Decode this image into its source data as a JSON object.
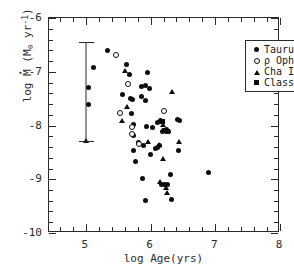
{
  "chart_data": {
    "type": "scatter",
    "title": "",
    "xlabel": "log Age(yrs)",
    "ylabel": "log Mdot (Msun yr^-1)",
    "xlabel_parts": {
      "prefix": "log Age(yrs)"
    },
    "ylabel_parts": {
      "log": "log",
      "mdot": "M",
      "open_paren": " (M",
      "sun": "⊙",
      "yr": " yr",
      "exp": "-1",
      "close_paren": ")"
    },
    "xlim": [
      4.43,
      8.0
    ],
    "ylim": [
      -10.0,
      -6.0
    ],
    "grid": false,
    "legend_position": "upper right",
    "xticks_major": [
      {
        "value": 5,
        "label": "5"
      },
      {
        "value": 6,
        "label": "6"
      },
      {
        "value": 7,
        "label": "7"
      },
      {
        "value": 8,
        "label": "8"
      }
    ],
    "xticks_minor": [
      4.6,
      4.8,
      5.2,
      5.4,
      5.6,
      5.8,
      6.2,
      6.4,
      6.6,
      6.8,
      7.2,
      7.4,
      7.6,
      7.8
    ],
    "yticks_major": [
      {
        "value": -6,
        "label": "-6"
      },
      {
        "value": -7,
        "label": "-7"
      },
      {
        "value": -8,
        "label": "-8"
      },
      {
        "value": -9,
        "label": "-9"
      },
      {
        "value": -10,
        "label": "-10"
      }
    ],
    "yticks_minor": [
      -6.2,
      -6.4,
      -6.6,
      -6.8,
      -7.2,
      -7.4,
      -7.6,
      -7.8,
      -8.2,
      -8.4,
      -8.6,
      -8.8,
      -9.2,
      -9.4,
      -9.6,
      -9.8
    ],
    "legend": [
      {
        "name": "Taurus",
        "marker": "filled-circle"
      },
      {
        "name": "ρ Oph",
        "marker": "open-circle"
      },
      {
        "name": "Cha I",
        "marker": "triangle"
      },
      {
        "name": "Class I Taurus",
        "marker": "square"
      }
    ],
    "errorbar": {
      "x": 5.0,
      "y_top": -6.45,
      "y_bottom": -8.3,
      "label": "representative-uncertainty"
    },
    "series": [
      {
        "name": "Taurus",
        "marker": "filled-circle",
        "points": [
          [
            5.04,
            -7.3
          ],
          [
            5.04,
            -7.6
          ],
          [
            5.12,
            -6.92
          ],
          [
            5.33,
            -6.6
          ],
          [
            5.62,
            -6.87
          ],
          [
            5.56,
            -7.42
          ],
          [
            5.68,
            -7.05
          ],
          [
            5.95,
            -7.02
          ],
          [
            5.86,
            -7.28
          ],
          [
            5.92,
            -7.26
          ],
          [
            5.99,
            -7.32
          ],
          [
            5.69,
            -7.5
          ],
          [
            5.72,
            -7.51
          ],
          [
            5.86,
            -7.46
          ],
          [
            5.92,
            -7.54
          ],
          [
            5.7,
            -7.77
          ],
          [
            5.73,
            -7.98
          ],
          [
            5.74,
            -8.18
          ],
          [
            5.74,
            -8.46
          ],
          [
            5.76,
            -8.67
          ],
          [
            5.82,
            -8.31
          ],
          [
            5.93,
            -8.02
          ],
          [
            6.03,
            -8.04
          ],
          [
            6.1,
            -7.94
          ],
          [
            6.16,
            -7.9
          ],
          [
            6.18,
            -8.12
          ],
          [
            6.22,
            -8.1
          ],
          [
            6.25,
            -8.07
          ],
          [
            6.27,
            -8.12
          ],
          [
            6.42,
            -7.88
          ],
          [
            6.45,
            -7.9
          ],
          [
            6.43,
            -8.46
          ],
          [
            5.89,
            -8.37
          ],
          [
            6.07,
            -8.42
          ],
          [
            6.11,
            -8.41
          ],
          [
            6.14,
            -8.38
          ],
          [
            6.0,
            -8.54
          ],
          [
            5.88,
            -8.98
          ],
          [
            6.17,
            -9.1
          ],
          [
            6.22,
            -9.09
          ],
          [
            6.26,
            -9.1
          ],
          [
            6.31,
            -8.91
          ],
          [
            6.33,
            -9.37
          ],
          [
            5.92,
            -9.4
          ],
          [
            6.9,
            -8.87
          ]
        ]
      },
      {
        "name": "ρ Oph",
        "marker": "open-circle",
        "points": [
          [
            5.47,
            -6.68
          ],
          [
            5.65,
            -7.22
          ],
          [
            5.53,
            -7.77
          ],
          [
            5.71,
            -8.02
          ],
          [
            5.71,
            -8.15
          ],
          [
            5.82,
            -8.35
          ],
          [
            6.21,
            -7.73
          ]
        ]
      },
      {
        "name": "Cha I",
        "marker": "triangle",
        "points": [
          [
            5.0,
            -8.28
          ],
          [
            5.61,
            -6.98
          ],
          [
            5.64,
            -7.65
          ],
          [
            5.56,
            -7.9
          ],
          [
            6.33,
            -7.37
          ],
          [
            6.19,
            -7.98
          ],
          [
            6.44,
            -8.3
          ],
          [
            5.96,
            -8.3
          ],
          [
            6.13,
            -8.35
          ],
          [
            6.19,
            -8.62
          ],
          [
            6.14,
            -9.05
          ],
          [
            6.24,
            -9.16
          ],
          [
            6.25,
            -9.25
          ]
        ]
      },
      {
        "name": "Class I Taurus",
        "marker": "square",
        "points": [
          [
            6.18,
            -7.92
          ],
          [
            6.22,
            -8.09
          ],
          [
            6.26,
            -8.11
          ]
        ]
      }
    ]
  }
}
